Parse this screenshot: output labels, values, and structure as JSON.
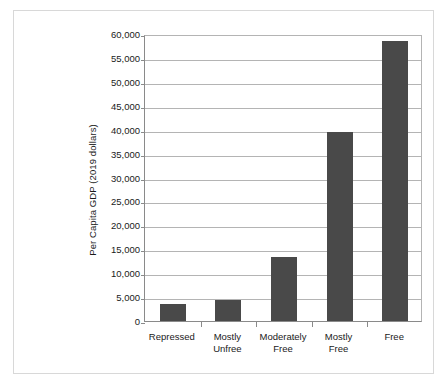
{
  "chart_data": {
    "type": "bar",
    "title": "",
    "subtitle": "",
    "xlabel": "",
    "ylabel": "Per Capita GDP (2019 dollars)",
    "categories": [
      "Repressed",
      "Mostly Unfree",
      "Moderately Free",
      "Mostly Free",
      "Free"
    ],
    "category_lines": [
      [
        "Repressed"
      ],
      [
        "Mostly",
        "Unfree"
      ],
      [
        "Moderately",
        "Free"
      ],
      [
        "Mostly",
        "Free"
      ],
      [
        "Free"
      ]
    ],
    "values": [
      3600,
      4300,
      13400,
      39500,
      58500
    ],
    "ylim": [
      0,
      60000
    ],
    "ytick_values": [
      0,
      5000,
      10000,
      15000,
      20000,
      25000,
      30000,
      35000,
      40000,
      45000,
      50000,
      55000,
      60000
    ],
    "ytick_labels": [
      "0",
      "5,000",
      "10,000",
      "15,000",
      "20,000",
      "25,000",
      "30,000",
      "35,000",
      "40,000",
      "45,000",
      "50,000",
      "55,000",
      "60,000"
    ],
    "grid": true,
    "legend": "none",
    "bar_color": "#494949",
    "gridline_color": "#b4b4b4",
    "axis_color": "#8a8a8a",
    "frame_color": "#d8d8d8",
    "background_color": "#ffffff"
  }
}
